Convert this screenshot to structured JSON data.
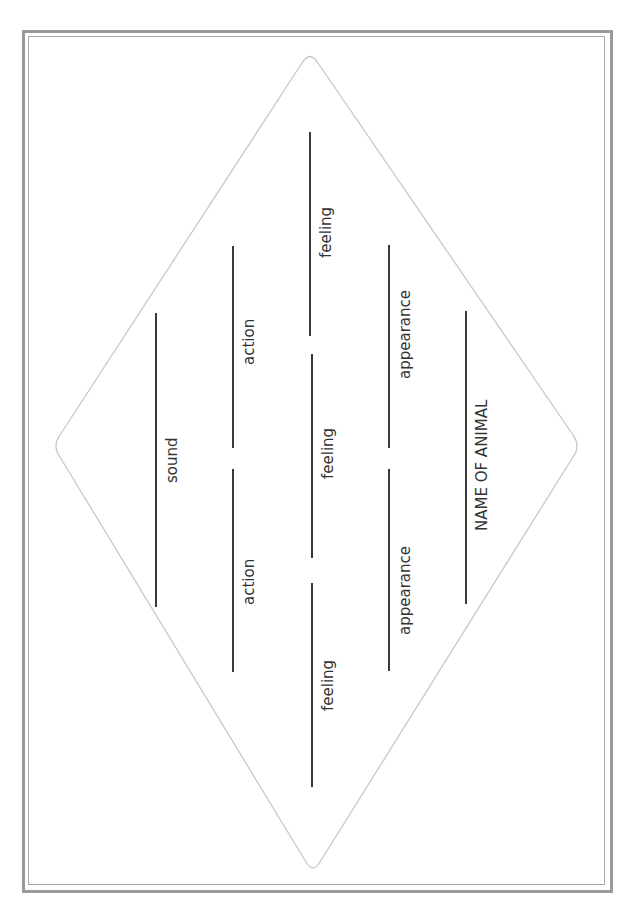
{
  "worksheet": {
    "type": "animal diamante poem template",
    "colors": {
      "frame": "#9a9a9a",
      "diamond_outline": "#c8c8c8",
      "line": "#3a3a3a",
      "text": "#333333"
    },
    "rows": [
      {
        "label": "sound"
      },
      {
        "labels": [
          "action",
          "action"
        ]
      },
      {
        "labels": [
          "feeling",
          "feeling",
          "feeling"
        ]
      },
      {
        "labels": [
          "appearance",
          "appearance"
        ]
      },
      {
        "label": "NAME OF ANIMAL"
      }
    ],
    "labels": {
      "sound": "sound",
      "action_top": "action",
      "action_bottom": "action",
      "feeling_top": "feeling",
      "feeling_middle": "feeling",
      "feeling_bottom": "feeling",
      "appearance_top": "appearance",
      "appearance_bottom": "appearance",
      "name": "NAME OF ANIMAL"
    }
  }
}
